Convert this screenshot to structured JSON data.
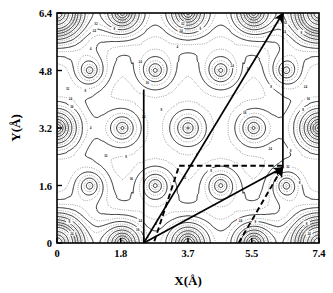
{
  "figure": {
    "title": "",
    "type": "contour-plot"
  },
  "axes": {
    "x_label": "X(Å)",
    "y_label": "Y(Å)",
    "x_ticks": [
      "0",
      "1.8",
      "3.7",
      "5.5",
      "7.4"
    ],
    "y_ticks": [
      "0",
      "1.6",
      "3.2",
      "4.8",
      "6.4"
    ]
  },
  "chart_data": {
    "type": "contour",
    "title": "",
    "xlabel": "X(Å)",
    "ylabel": "Y(Å)",
    "xlim": [
      0,
      7.4
    ],
    "ylim": [
      0,
      6.4
    ],
    "x_ticks": [
      0,
      1.8,
      3.7,
      5.5,
      7.4
    ],
    "y_ticks": [
      0,
      1.6,
      3.2,
      4.8,
      6.4
    ],
    "grid": false,
    "legend": "none",
    "contour_levels": [
      4,
      8,
      16,
      24,
      32
    ],
    "contour_labels": [
      "4",
      "8",
      "16",
      "24",
      "32"
    ],
    "linestyles": [
      "solid",
      "dotted"
    ],
    "atom_sites": [
      {
        "x": 0.0,
        "y": 0.0
      },
      {
        "x": 1.85,
        "y": 0.0
      },
      {
        "x": 3.7,
        "y": 0.0
      },
      {
        "x": 5.55,
        "y": 0.0
      },
      {
        "x": 7.4,
        "y": 0.0
      },
      {
        "x": 0.925,
        "y": 1.6
      },
      {
        "x": 2.775,
        "y": 1.6
      },
      {
        "x": 4.625,
        "y": 1.6
      },
      {
        "x": 6.475,
        "y": 1.6
      },
      {
        "x": 0.0,
        "y": 3.2
      },
      {
        "x": 1.85,
        "y": 3.2
      },
      {
        "x": 3.7,
        "y": 3.2
      },
      {
        "x": 5.55,
        "y": 3.2
      },
      {
        "x": 7.4,
        "y": 3.2
      },
      {
        "x": 0.925,
        "y": 4.8
      },
      {
        "x": 2.775,
        "y": 4.8
      },
      {
        "x": 4.625,
        "y": 4.8
      },
      {
        "x": 6.475,
        "y": 4.8
      },
      {
        "x": 0.0,
        "y": 6.4
      },
      {
        "x": 1.85,
        "y": 6.4
      },
      {
        "x": 3.7,
        "y": 6.4
      },
      {
        "x": 5.55,
        "y": 6.4
      },
      {
        "x": 7.4,
        "y": 6.4
      }
    ],
    "unit_cell_polygon": [
      {
        "x": 2.45,
        "y": 0.0
      },
      {
        "x": 2.45,
        "y": 4.27
      },
      {
        "x": 6.38,
        "y": 6.4
      },
      {
        "x": 6.38,
        "y": 2.1
      }
    ],
    "vectors": [
      {
        "name": "vector-horizontal",
        "from": {
          "x": 3.45,
          "y": 2.15
        },
        "to": {
          "x": 6.38,
          "y": 2.15
        },
        "style": "dashed",
        "arrow": false
      },
      {
        "name": "vector-lower-left",
        "from": {
          "x": 2.75,
          "y": 0.05
        },
        "to": {
          "x": 3.45,
          "y": 2.15
        },
        "style": "dashed",
        "arrow": false
      },
      {
        "name": "vector-lower-right",
        "from": {
          "x": 5.13,
          "y": 0.0
        },
        "to": {
          "x": 6.38,
          "y": 2.12
        },
        "style": "dashed",
        "arrow": true
      },
      {
        "name": "vector-diagonal-long",
        "from": {
          "x": 2.45,
          "y": 0.0
        },
        "to": {
          "x": 6.38,
          "y": 6.4
        },
        "style": "solid",
        "arrow": true
      },
      {
        "name": "vector-diagonal-short",
        "from": {
          "x": 2.45,
          "y": 0.0
        },
        "to": {
          "x": 6.38,
          "y": 2.1
        },
        "style": "solid",
        "arrow": true
      }
    ]
  },
  "colors": {
    "line": "#000000",
    "background": "#ffffff",
    "contour_solid": "#1a1a1a",
    "contour_dotted": "#555555"
  }
}
